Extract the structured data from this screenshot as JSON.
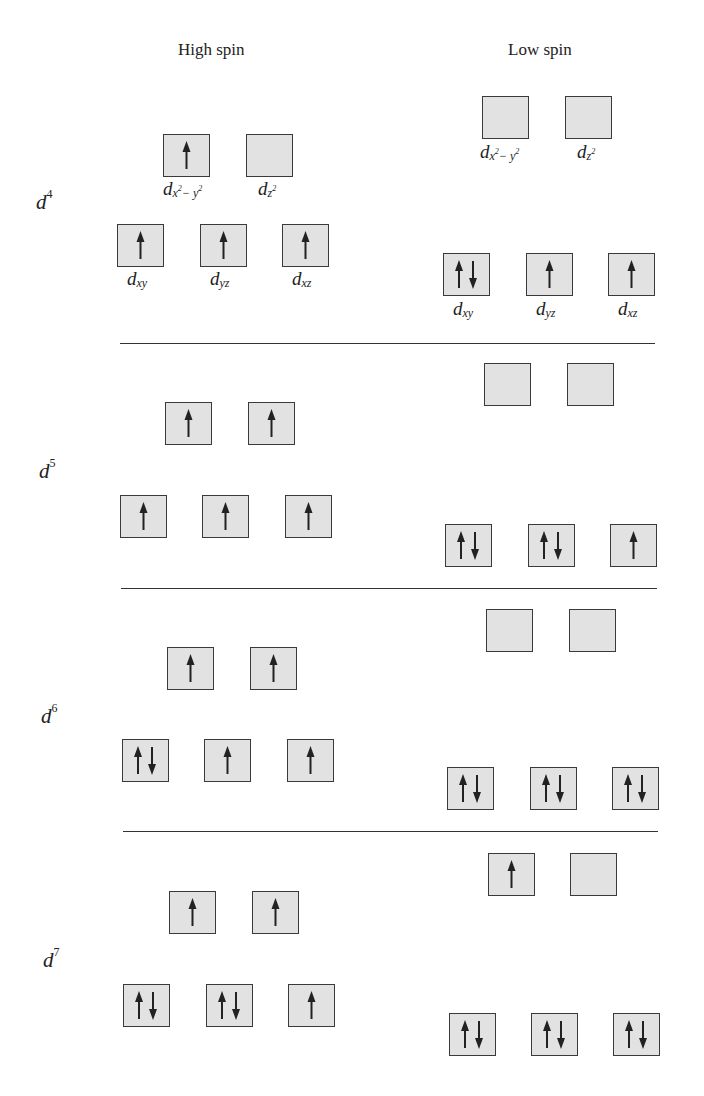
{
  "headers": {
    "high_spin": "High spin",
    "low_spin": "Low spin"
  },
  "colors": {
    "box_fill": "#e2e2e2",
    "box_border": "#3a3a3a",
    "arrow": "#222222",
    "divider": "#333333"
  },
  "orbital_labels": {
    "dx2y2_base": "d",
    "dx2y2_sub_x": "x",
    "dx2y2_sup_1": "2",
    "dx2y2_minus": "− y",
    "dx2y2_sup_2": "2",
    "dz2_base": "d",
    "dz2_sub": "z",
    "dz2_sup": "2",
    "dxy_base": "d",
    "dxy_sub": "xy",
    "dyz_base": "d",
    "dyz_sub": "yz",
    "dxz_base": "d",
    "dxz_sub": "xz"
  },
  "configurations": [
    {
      "label_base": "d",
      "label_sup": "4",
      "high_spin": {
        "eg": [
          {
            "orbital": "dx2-y2",
            "electrons": "up"
          },
          {
            "orbital": "dz2",
            "electrons": "empty"
          }
        ],
        "t2g": [
          {
            "orbital": "dxy",
            "electrons": "up"
          },
          {
            "orbital": "dyz",
            "electrons": "up"
          },
          {
            "orbital": "dxz",
            "electrons": "up"
          }
        ]
      },
      "low_spin": {
        "eg": [
          {
            "orbital": "dx2-y2",
            "electrons": "empty"
          },
          {
            "orbital": "dz2",
            "electrons": "empty"
          }
        ],
        "t2g": [
          {
            "orbital": "dxy",
            "electrons": "pair"
          },
          {
            "orbital": "dyz",
            "electrons": "up"
          },
          {
            "orbital": "dxz",
            "electrons": "up"
          }
        ]
      }
    },
    {
      "label_base": "d",
      "label_sup": "5",
      "high_spin": {
        "eg": [
          {
            "electrons": "up"
          },
          {
            "electrons": "up"
          }
        ],
        "t2g": [
          {
            "electrons": "up"
          },
          {
            "electrons": "up"
          },
          {
            "electrons": "up"
          }
        ]
      },
      "low_spin": {
        "eg": [
          {
            "electrons": "empty"
          },
          {
            "electrons": "empty"
          }
        ],
        "t2g": [
          {
            "electrons": "pair"
          },
          {
            "electrons": "pair"
          },
          {
            "electrons": "up"
          }
        ]
      }
    },
    {
      "label_base": "d",
      "label_sup": "6",
      "high_spin": {
        "eg": [
          {
            "electrons": "up"
          },
          {
            "electrons": "up"
          }
        ],
        "t2g": [
          {
            "electrons": "pair"
          },
          {
            "electrons": "up"
          },
          {
            "electrons": "up"
          }
        ]
      },
      "low_spin": {
        "eg": [
          {
            "electrons": "empty"
          },
          {
            "electrons": "empty"
          }
        ],
        "t2g": [
          {
            "electrons": "pair"
          },
          {
            "electrons": "pair"
          },
          {
            "electrons": "pair"
          }
        ]
      }
    },
    {
      "label_base": "d",
      "label_sup": "7",
      "high_spin": {
        "eg": [
          {
            "electrons": "up"
          },
          {
            "electrons": "up"
          }
        ],
        "t2g": [
          {
            "electrons": "pair"
          },
          {
            "electrons": "pair"
          },
          {
            "electrons": "up"
          }
        ]
      },
      "low_spin": {
        "eg": [
          {
            "electrons": "up"
          },
          {
            "electrons": "empty"
          }
        ],
        "t2g": [
          {
            "electrons": "pair"
          },
          {
            "electrons": "pair"
          },
          {
            "electrons": "pair"
          }
        ]
      }
    }
  ]
}
